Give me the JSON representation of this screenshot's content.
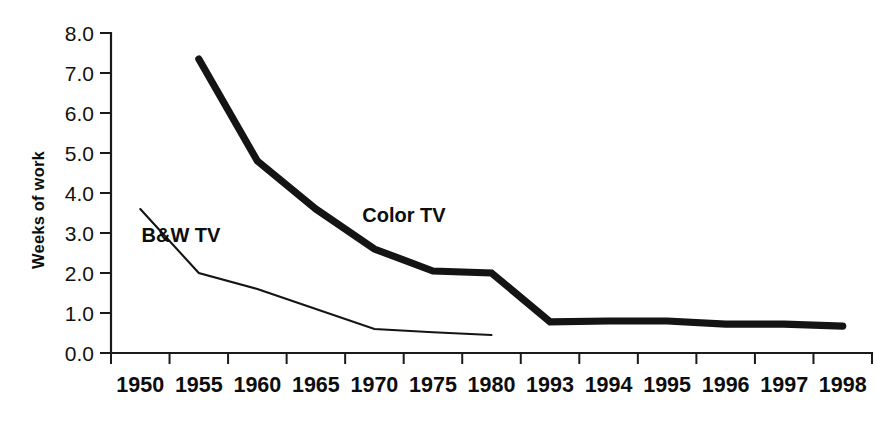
{
  "chart_data": {
    "type": "line",
    "title": "",
    "xlabel": "",
    "ylabel": "Weeks of work",
    "categories": [
      "1950",
      "1955",
      "1960",
      "1965",
      "1970",
      "1975",
      "1980",
      "1993",
      "1994",
      "1995",
      "1996",
      "1997",
      "1998"
    ],
    "ylim": [
      0.0,
      8.0
    ],
    "ytick_labels": [
      "0.0",
      "1.0",
      "2.0",
      "3.0",
      "4.0",
      "5.0",
      "6.0",
      "7.0",
      "8.0"
    ],
    "ytick_values": [
      0.0,
      1.0,
      2.0,
      3.0,
      4.0,
      5.0,
      6.0,
      7.0,
      8.0
    ],
    "grid": false,
    "legend_position": "inline-annotations",
    "series": [
      {
        "name": "Color TV",
        "style": "thick",
        "values": [
          null,
          7.35,
          4.8,
          3.6,
          2.6,
          2.05,
          2.0,
          0.78,
          0.8,
          0.8,
          0.72,
          0.72,
          0.67
        ]
      },
      {
        "name": "B&W TV",
        "style": "thin",
        "values": [
          3.6,
          2.0,
          1.6,
          1.1,
          0.6,
          0.52,
          0.45,
          null,
          null,
          null,
          null,
          null,
          null
        ]
      }
    ],
    "annotations": [
      {
        "text": "Color TV",
        "x_px": 404,
        "y_px": 222
      },
      {
        "text": "B&W TV",
        "x_px": 181,
        "y_px": 242
      }
    ]
  }
}
